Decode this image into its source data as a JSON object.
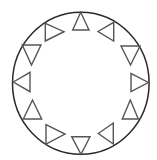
{
  "diagram": {
    "type": "ring-of-triangles",
    "width": 157,
    "height": 160,
    "background": "#ffffff",
    "ring": {
      "cx": 80.8,
      "cy": 83.3,
      "rx": 68.3,
      "ry": 71,
      "stroke": "#2a2a2a"
    },
    "triangle_stroke": "#555555",
    "triangles": [
      {
        "position_deg": 0,
        "points_direction": "up",
        "points": "80.7,12.3 72.7,30 89,30"
      },
      {
        "position_deg": 30,
        "points_direction": "left",
        "points": "98,31.5 113.7,22.3 113.7,41"
      },
      {
        "position_deg": 60,
        "points_direction": "down",
        "points": "121,46 140,46 130.5,65"
      },
      {
        "position_deg": 90,
        "points_direction": "right",
        "points": "131,73.3 131,91.7 148.3,82.5"
      },
      {
        "position_deg": 120,
        "points_direction": "up",
        "points": "130.3,100 122.3,119 138.3,119"
      },
      {
        "position_deg": 150,
        "points_direction": "left",
        "points": "98.3,133.5 113.3,123 113.3,144"
      },
      {
        "position_deg": 180,
        "points_direction": "down",
        "points": "71.7,136.7 90,136.7 81,154.3"
      },
      {
        "position_deg": 210,
        "points_direction": "right",
        "points": "46,124.7 46,144 65,134"
      },
      {
        "position_deg": 240,
        "points_direction": "up",
        "points": "32.5,100 23.3,119 41.7,119"
      },
      {
        "position_deg": 270,
        "points_direction": "left",
        "points": "13.3,82 30,72.3 30,91.7"
      },
      {
        "position_deg": 300,
        "points_direction": "down",
        "points": "22.3,45 41,45 31.5,65"
      },
      {
        "position_deg": 330,
        "points_direction": "right",
        "points": "45.3,23.3 45.3,41 64,31.7"
      }
    ]
  }
}
